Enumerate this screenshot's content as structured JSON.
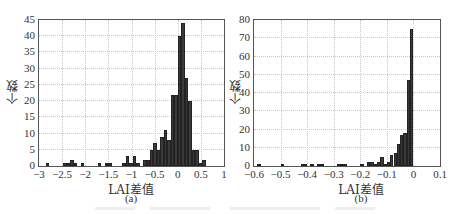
{
  "chart_data": [
    {
      "type": "bar",
      "id": "a",
      "subtitle": "(a)",
      "xlabel": "LAI差值",
      "ylabel": "个数",
      "xlim": [
        -3,
        1
      ],
      "ylim": [
        0,
        45
      ],
      "xticks": [
        "-3",
        "-2.5",
        "-2",
        "-1.5",
        "-1",
        "-0.5",
        "0",
        "0.5",
        "1"
      ],
      "xtick_values": [
        -3,
        -2.5,
        -2,
        -1.5,
        -1,
        -0.5,
        0,
        0.5,
        1
      ],
      "yticks": [
        "0",
        "5",
        "10",
        "15",
        "20",
        "25",
        "30",
        "35",
        "40",
        "45"
      ],
      "ytick_values": [
        0,
        5,
        10,
        15,
        20,
        25,
        30,
        35,
        40,
        45
      ],
      "grid": true,
      "bin_width": 0.075,
      "bins": [
        {
          "x": -2.85,
          "count": 1
        },
        {
          "x": -2.475,
          "count": 1
        },
        {
          "x": -2.4,
          "count": 1
        },
        {
          "x": -2.325,
          "count": 2
        },
        {
          "x": -2.25,
          "count": 1
        },
        {
          "x": -2.1,
          "count": 1
        },
        {
          "x": -1.725,
          "count": 1
        },
        {
          "x": -1.575,
          "count": 1
        },
        {
          "x": -1.5,
          "count": 1
        },
        {
          "x": -1.2,
          "count": 1
        },
        {
          "x": -1.125,
          "count": 3
        },
        {
          "x": -1.05,
          "count": 1
        },
        {
          "x": -0.975,
          "count": 3
        },
        {
          "x": -0.9,
          "count": 1
        },
        {
          "x": -0.75,
          "count": 2
        },
        {
          "x": -0.675,
          "count": 2
        },
        {
          "x": -0.6,
          "count": 5
        },
        {
          "x": -0.525,
          "count": 7
        },
        {
          "x": -0.45,
          "count": 5
        },
        {
          "x": -0.375,
          "count": 9
        },
        {
          "x": -0.3,
          "count": 11
        },
        {
          "x": -0.225,
          "count": 8
        },
        {
          "x": -0.15,
          "count": 22
        },
        {
          "x": -0.075,
          "count": 22
        },
        {
          "x": 0.0,
          "count": 40
        },
        {
          "x": 0.075,
          "count": 44
        },
        {
          "x": 0.15,
          "count": 27
        },
        {
          "x": 0.225,
          "count": 20
        },
        {
          "x": 0.3,
          "count": 5
        },
        {
          "x": 0.375,
          "count": 5
        },
        {
          "x": 0.45,
          "count": 1
        },
        {
          "x": 0.525,
          "count": 2
        }
      ]
    },
    {
      "type": "bar",
      "id": "b",
      "subtitle": "(b)",
      "xlabel": "LAI差值",
      "ylabel": "个数",
      "xlim": [
        -0.6,
        0.1
      ],
      "ylim": [
        0,
        80
      ],
      "xticks": [
        "-0.6",
        "-0.5",
        "-0.4",
        "-0.3",
        "-0.2",
        "-0.1",
        "0",
        "0.1"
      ],
      "xtick_values": [
        -0.6,
        -0.5,
        -0.4,
        -0.3,
        -0.2,
        -0.1,
        0,
        0.1
      ],
      "yticks": [
        "0",
        "10",
        "20",
        "30",
        "40",
        "50",
        "60",
        "70",
        "80"
      ],
      "ytick_values": [
        0,
        10,
        20,
        30,
        40,
        50,
        60,
        70,
        80
      ],
      "grid": true,
      "bin_width": 0.0125,
      "bins": [
        {
          "x": -0.5875,
          "count": 1
        },
        {
          "x": -0.5,
          "count": 1
        },
        {
          "x": -0.425,
          "count": 1
        },
        {
          "x": -0.4125,
          "count": 1
        },
        {
          "x": -0.3875,
          "count": 1
        },
        {
          "x": -0.3625,
          "count": 1
        },
        {
          "x": -0.35,
          "count": 1
        },
        {
          "x": -0.2875,
          "count": 1
        },
        {
          "x": -0.275,
          "count": 1
        },
        {
          "x": -0.2625,
          "count": 1
        },
        {
          "x": -0.2,
          "count": 1
        },
        {
          "x": -0.175,
          "count": 2
        },
        {
          "x": -0.1625,
          "count": 2
        },
        {
          "x": -0.15,
          "count": 1
        },
        {
          "x": -0.1375,
          "count": 2
        },
        {
          "x": -0.125,
          "count": 5
        },
        {
          "x": -0.1125,
          "count": 1
        },
        {
          "x": -0.1,
          "count": 2
        },
        {
          "x": -0.0875,
          "count": 6
        },
        {
          "x": -0.075,
          "count": 7
        },
        {
          "x": -0.0625,
          "count": 12
        },
        {
          "x": -0.05,
          "count": 17
        },
        {
          "x": -0.0375,
          "count": 18
        },
        {
          "x": -0.025,
          "count": 47
        },
        {
          "x": -0.0125,
          "count": 75
        },
        {
          "x": -0.0125,
          "count": 0
        },
        {
          "x": 0.0,
          "count": 0
        }
      ]
    }
  ],
  "charts": {
    "a": {
      "ylabel": "个数",
      "xlabel": "LAI差值",
      "subtitle": "(a)"
    },
    "b": {
      "ylabel": "个数",
      "xlabel": "LAI差值",
      "subtitle": "(b)"
    }
  },
  "colors": {
    "bar": "#3a3a3a",
    "grid": "#c8c8c8",
    "axis": "#555555"
  }
}
